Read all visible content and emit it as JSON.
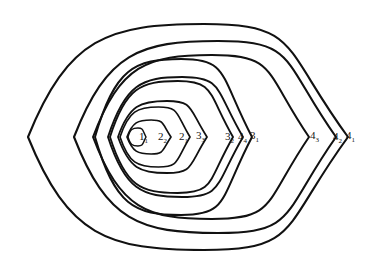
{
  "figure": {
    "background_color": "#ffffff",
    "stroke_color": "#111111",
    "label_color": "#141414",
    "width": 373,
    "height": 264
  },
  "chart_data": {
    "type": "line",
    "xlabel": "",
    "ylabel": "",
    "grid": false,
    "legend": "none",
    "xlim": [
      0,
      373
    ],
    "ylim": [
      0,
      264
    ],
    "common_left_vertex": [
      131,
      137
    ],
    "axis_y": 137,
    "series": [
      {
        "name": "1_1",
        "label": "1",
        "subscript": "1",
        "left_x": 128,
        "right_x": 146,
        "half_height": 9,
        "center_x": 137,
        "center_y": 137
      },
      {
        "name": "2_2",
        "label": "2",
        "subscript": "2",
        "left_x": 127,
        "right_x": 171,
        "half_height": 17,
        "center_x": 149,
        "center_y": 137
      },
      {
        "name": "2_1",
        "label": "2",
        "subscript": "1",
        "left_x": 120,
        "right_x": 190,
        "half_height": 30,
        "center_x": 155,
        "center_y": 137
      },
      {
        "name": "3_3",
        "label": "3",
        "subscript": "3",
        "left_x": 118,
        "right_x": 207,
        "half_height": 36,
        "center_x": 162,
        "center_y": 137
      },
      {
        "name": "3_2",
        "label": "3",
        "subscript": "2",
        "left_x": 110,
        "right_x": 233,
        "half_height": 56,
        "center_x": 171,
        "center_y": 137
      },
      {
        "name": "4_4",
        "label": "4",
        "subscript": "4",
        "left_x": 108,
        "right_x": 243,
        "half_height": 60,
        "center_x": 175,
        "center_y": 137
      },
      {
        "name": "3_1",
        "label": "3",
        "subscript": "1",
        "left_x": 95,
        "right_x": 252,
        "half_height": 78,
        "center_x": 173,
        "center_y": 137
      },
      {
        "name": "4_3",
        "label": "4",
        "subscript": "3",
        "left_x": 93,
        "right_x": 309,
        "half_height": 82,
        "center_x": 201,
        "center_y": 137
      },
      {
        "name": "4_2",
        "label": "4",
        "subscript": "2",
        "left_x": 74,
        "right_x": 336,
        "half_height": 96,
        "center_x": 205,
        "center_y": 137
      },
      {
        "name": "4_1",
        "label": "4",
        "subscript": "1",
        "left_x": 28,
        "right_x": 348,
        "half_height": 113,
        "center_x": 188,
        "center_y": 137
      }
    ]
  },
  "labels": [
    {
      "id": "label-1-1",
      "base": "1",
      "sub": "1",
      "x": 139,
      "y": 131
    },
    {
      "id": "label-2-2",
      "base": "2",
      "sub": "2",
      "x": 158,
      "y": 131
    },
    {
      "id": "label-2-1",
      "base": "2",
      "sub": "1",
      "x": 179,
      "y": 131
    },
    {
      "id": "label-3-3",
      "base": "3",
      "sub": "3",
      "x": 196,
      "y": 130
    },
    {
      "id": "label-3-2",
      "base": "3",
      "sub": "2",
      "x": 225,
      "y": 131
    },
    {
      "id": "label-4-4",
      "base": "4",
      "sub": "4",
      "x": 238,
      "y": 131
    },
    {
      "id": "label-3-1",
      "base": "3",
      "sub": "1",
      "x": 250,
      "y": 130
    },
    {
      "id": "label-4-3",
      "base": "4",
      "sub": "3",
      "x": 310,
      "y": 130
    },
    {
      "id": "label-4-2",
      "base": "4",
      "sub": "2",
      "x": 333,
      "y": 131
    },
    {
      "id": "label-4-1",
      "base": "4",
      "sub": "1",
      "x": 346,
      "y": 130
    }
  ]
}
